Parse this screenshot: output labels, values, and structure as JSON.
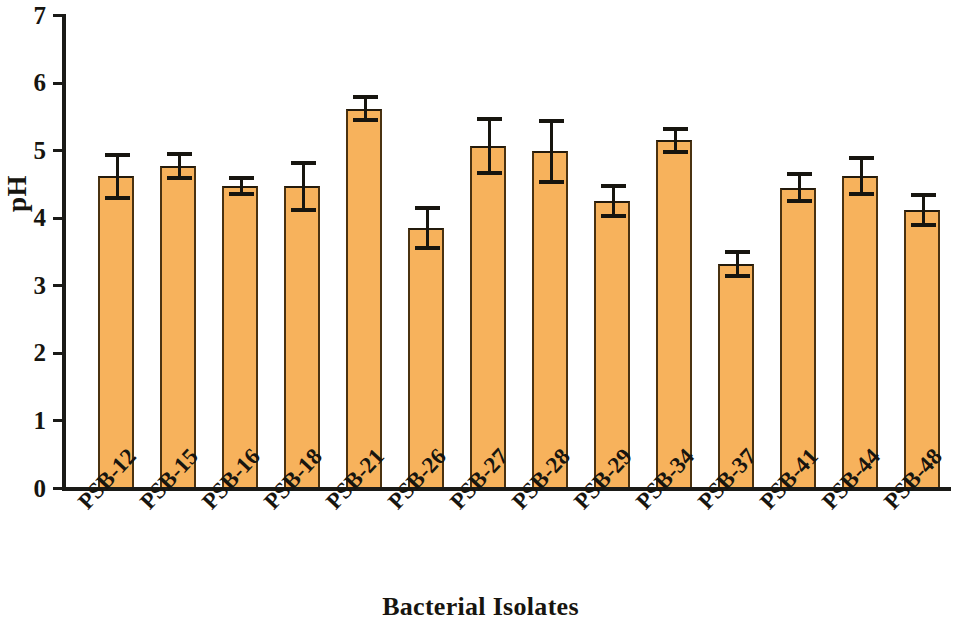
{
  "chart_data": {
    "type": "bar",
    "title": "",
    "xlabel": "Bacterial Isolates",
    "ylabel": "pH",
    "ylim": [
      0,
      7
    ],
    "yticks": [
      0,
      1,
      2,
      3,
      4,
      5,
      6,
      7
    ],
    "ytick_labels": [
      "0",
      "1",
      "2",
      "3",
      "4",
      "5",
      "6",
      "7"
    ],
    "grid": false,
    "legend": null,
    "bar_color": "#f7b25c",
    "bar_edge_color": "#3a2a10",
    "error_bar_color": "#17150f",
    "categories": [
      "PSB-12",
      "PSB-15",
      "PSB-16",
      "PSB-18",
      "PSB-21",
      "PSB-26",
      "PSB-27",
      "PSB-28",
      "PSB-29",
      "PSB-34",
      "PSB-37",
      "PSB-41",
      "PSB-44",
      "PSB-48"
    ],
    "values": [
      4.6,
      4.75,
      4.45,
      4.45,
      5.6,
      3.83,
      5.05,
      4.97,
      4.23,
      5.13,
      3.3,
      4.43,
      4.6,
      4.1
    ],
    "errors": [
      0.32,
      0.18,
      0.12,
      0.35,
      0.17,
      0.3,
      0.4,
      0.45,
      0.22,
      0.17,
      0.18,
      0.2,
      0.27,
      0.22
    ],
    "bars": [
      {
        "category": "PSB-12",
        "value": 4.6,
        "error": 0.32,
        "error_low": 4.28,
        "error_high": 4.92
      },
      {
        "category": "PSB-15",
        "value": 4.75,
        "error": 0.18,
        "error_low": 4.57,
        "error_high": 4.93
      },
      {
        "category": "PSB-16",
        "value": 4.45,
        "error": 0.12,
        "error_low": 4.33,
        "error_high": 4.57
      },
      {
        "category": "PSB-18",
        "value": 4.45,
        "error": 0.35,
        "error_low": 4.1,
        "error_high": 4.8
      },
      {
        "category": "PSB-21",
        "value": 5.6,
        "error": 0.17,
        "error_low": 5.43,
        "error_high": 5.77
      },
      {
        "category": "PSB-26",
        "value": 3.83,
        "error": 0.3,
        "error_low": 3.53,
        "error_high": 4.13
      },
      {
        "category": "PSB-27",
        "value": 5.05,
        "error": 0.4,
        "error_low": 4.65,
        "error_high": 5.45
      },
      {
        "category": "PSB-28",
        "value": 4.97,
        "error": 0.45,
        "error_low": 4.52,
        "error_high": 5.42
      },
      {
        "category": "PSB-29",
        "value": 4.23,
        "error": 0.22,
        "error_low": 4.01,
        "error_high": 4.45
      },
      {
        "category": "PSB-34",
        "value": 5.13,
        "error": 0.17,
        "error_low": 4.96,
        "error_high": 5.3
      },
      {
        "category": "PSB-37",
        "value": 3.3,
        "error": 0.18,
        "error_low": 3.12,
        "error_high": 3.48
      },
      {
        "category": "PSB-41",
        "value": 4.43,
        "error": 0.2,
        "error_low": 4.23,
        "error_high": 4.63
      },
      {
        "category": "PSB-44",
        "value": 4.6,
        "error": 0.27,
        "error_low": 4.33,
        "error_high": 4.87
      },
      {
        "category": "PSB-48",
        "value": 4.1,
        "error": 0.22,
        "error_low": 3.88,
        "error_high": 4.32
      }
    ]
  }
}
